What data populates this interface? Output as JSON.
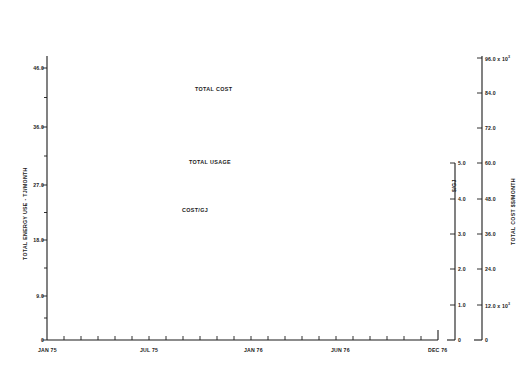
{
  "chart_data": {
    "type": "line",
    "title": "",
    "xlabel": "",
    "ylabel": "TOTAL ENERGY USE - TJ/MONTH",
    "grid": false,
    "legend_position": "inline-annotations",
    "x_axis": {
      "ticks_major": [
        "JAN 75",
        "JUL 75",
        "JAN 76",
        "JUN 76",
        "DEC 76"
      ],
      "tick_positions_major": [
        0,
        6,
        12,
        17,
        23
      ],
      "minor_tick_count": 24,
      "range": [
        0,
        23
      ],
      "note": "monthly ticks from JAN 75 through DEC 76"
    },
    "axes": [
      {
        "id": "left",
        "title": "TOTAL ENERGY USE - TJ/MONTH",
        "ticks": [
          "0",
          "9.0",
          "18.0",
          "27.0",
          "36.0",
          "46.0"
        ],
        "values": [
          0,
          9.0,
          18.0,
          27.0,
          36.0,
          46.0
        ],
        "range": [
          0,
          46.0
        ],
        "side": "left"
      },
      {
        "id": "dollars-per-gj",
        "title": "$/GJ",
        "ticks": [
          "0",
          "1.0",
          "2.0",
          "3.0",
          "4.0",
          "5.0"
        ],
        "values": [
          0,
          1.0,
          2.0,
          3.0,
          4.0,
          5.0
        ],
        "range": [
          0,
          5.0
        ],
        "side": "right-inner"
      },
      {
        "id": "total-cost",
        "title": "TOTAL COST $$/MONTH",
        "ticks": [
          "0",
          "12.0 x 10³",
          "24.0",
          "36.0",
          "48.0",
          "60.0",
          "72.0",
          "84.0",
          "96.0 x 10³"
        ],
        "tick_values": [
          0,
          12000,
          24000,
          36000,
          48000,
          60000,
          72000,
          84000,
          96000
        ],
        "range": [
          0,
          96000
        ],
        "side": "right-outer"
      }
    ],
    "series": [
      {
        "name": "TOTAL COST",
        "axis": "total-cost",
        "unit": "$/month",
        "label_x": 195,
        "label_y": 89,
        "x": [
          0,
          1,
          2,
          3,
          4,
          5,
          6,
          7,
          8,
          9,
          10,
          11,
          12,
          13,
          14,
          15,
          16,
          17,
          18,
          19,
          20,
          21,
          22,
          23
        ],
        "values": [
          93500,
          91500,
          85500,
          82000,
          82000,
          73000,
          77500,
          65500,
          44000,
          57000,
          72000,
          78000,
          78000,
          70500,
          82500,
          79000,
          79000,
          84000,
          83500,
          62500,
          52500,
          94000,
          93500,
          78000
        ]
      },
      {
        "name": "TOTAL USAGE",
        "axis": "left",
        "unit": "TJ/month",
        "label_x": 189,
        "label_y": 162,
        "x": [
          0,
          1,
          2,
          3,
          4,
          5,
          6,
          7,
          8,
          9,
          10,
          11,
          12,
          13,
          14,
          15,
          16,
          17,
          18,
          19,
          20,
          21,
          22,
          23
        ],
        "values": [
          42.5,
          38.5,
          31.5,
          24.0,
          27.5,
          22.0,
          26.5,
          19.5,
          15.0,
          21.5,
          23.5,
          23.0,
          27.0,
          33.5,
          29.5,
          24.0,
          24.5,
          29.0,
          24.5,
          21.0,
          19.0,
          20.0,
          20.5,
          18.5
        ]
      },
      {
        "name": "COST/GJ",
        "axis": "dollars-per-gj",
        "unit": "$/GJ",
        "label_x": 182,
        "label_y": 210,
        "x": [
          0,
          1,
          2,
          3,
          4,
          5,
          6,
          7,
          8,
          9,
          10,
          11,
          12,
          13,
          14,
          15,
          16,
          17,
          18,
          19,
          20,
          21,
          22,
          23
        ],
        "values": [
          2.2,
          2.2,
          2.4,
          2.45,
          2.65,
          2.55,
          2.7,
          2.9,
          2.15,
          2.9,
          2.95,
          2.95,
          2.8,
          2.7,
          2.75,
          2.95,
          3.05,
          3.05,
          3.3,
          3.5,
          3.7,
          3.8,
          3.65,
          3.45
        ]
      }
    ]
  },
  "labels": {
    "left_axis_title": "TOTAL ENERGY USE - TJ/MONTH",
    "gj_axis_title": "$/GJ",
    "cost_axis_title": "TOTAL COST $$/MONTH",
    "left_ticks": [
      "46.0",
      "36.0",
      "27.0",
      "18.0",
      "9.0",
      "0"
    ],
    "gj_ticks": [
      "5.0",
      "4.0",
      "3.0",
      "2.0",
      "1.0",
      "0"
    ],
    "cost_ticks": [
      "96.0 x 10",
      "84.0",
      "72.0",
      "60.0",
      "48.0",
      "36.0",
      "24.0",
      "12.0 x 10",
      "0"
    ],
    "cost_tick_exponent": "3",
    "x_ticks": [
      "JAN 75",
      "JUL 75",
      "JAN 76",
      "JUN 76",
      "DEC 76"
    ],
    "series_total_cost": "TOTAL COST",
    "series_total_usage": "TOTAL USAGE",
    "series_cost_per_gj": "COST/GJ"
  },
  "colors": {
    "line": "#1a1a1a",
    "axis": "#1a1a1a",
    "background": "#ffffff"
  }
}
